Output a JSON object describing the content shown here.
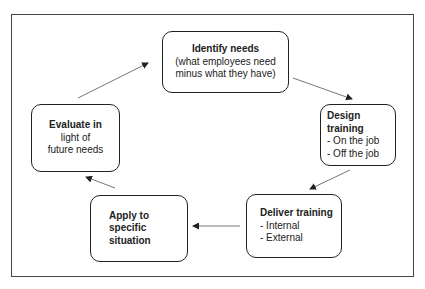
{
  "diagram": {
    "type": "cycle",
    "nodes": [
      {
        "id": "identify",
        "title": "Identify needs",
        "lines": [
          "(what employees need",
          "minus what they have)"
        ]
      },
      {
        "id": "design",
        "title": "Design training",
        "lines": [
          "- On the job",
          "- Off the job"
        ]
      },
      {
        "id": "deliver",
        "title": "Deliver training",
        "lines": [
          "- Internal",
          "- External"
        ]
      },
      {
        "id": "apply",
        "title": "Apply to",
        "lines": [
          "specific",
          "situation"
        ]
      },
      {
        "id": "evaluate",
        "title": "Evaluate in",
        "lines": [
          "light of",
          "future needs"
        ]
      }
    ],
    "edges": [
      {
        "from": "identify",
        "to": "design"
      },
      {
        "from": "design",
        "to": "deliver"
      },
      {
        "from": "deliver",
        "to": "apply"
      },
      {
        "from": "apply",
        "to": "evaluate"
      },
      {
        "from": "evaluate",
        "to": "identify"
      }
    ]
  }
}
